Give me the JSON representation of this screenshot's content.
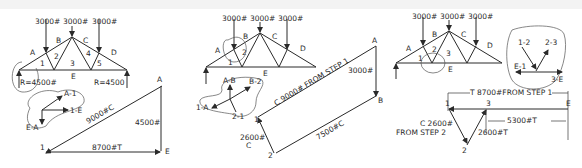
{
  "figure": {
    "panels": [
      {
        "id": "step1",
        "loads": [
          "3000#",
          "3000#",
          "3000#"
        ],
        "regions": [
          "A",
          "B",
          "C",
          "D",
          "E",
          "1",
          "2",
          "3",
          "4",
          "5"
        ],
        "reactions": {
          "left": "R=4500#",
          "right": "R=4500"
        },
        "free_body": {
          "vectors": [
            "A-1",
            "1-E",
            "E-A"
          ]
        },
        "force_polygon": {
          "points": [
            "A",
            "E",
            "1"
          ],
          "labels": {
            "hyp": "9000#C",
            "vert": "4500#",
            "base": "8700#T"
          }
        }
      },
      {
        "id": "step2",
        "loads": [
          "3000#",
          "3000#",
          "3000#"
        ],
        "regions": [
          "A",
          "B",
          "C",
          "D",
          "E",
          "1",
          "2"
        ],
        "free_body": {
          "vectors": [
            "A-B",
            "B-2",
            "1-A",
            "2-1"
          ]
        },
        "force_polygon": {
          "points": [
            "A",
            "B",
            "1",
            "2"
          ],
          "labels": {
            "top": "C 9000# FROM STEP 1",
            "vert": "3000#",
            "bottom": "7500#C",
            "left_value": "2600#",
            "left_type": "C"
          }
        }
      },
      {
        "id": "step3",
        "loads": [
          "3000#",
          "3000#",
          "3000#"
        ],
        "regions": [
          "A",
          "B",
          "C",
          "D",
          "E",
          "1",
          "2",
          "3"
        ],
        "free_body": {
          "vectors": [
            "1-2",
            "2-3",
            "E-1",
            "3-E"
          ]
        },
        "force_polygon": {
          "points": [
            "1",
            "3",
            "E",
            "2"
          ],
          "labels": {
            "top_dim": "T  8700#FROM STEP 1",
            "right_dim": "5300#T",
            "left_value": "C  2600#",
            "left_note": "FROM STEP 2",
            "right_leg": "2600#T"
          }
        }
      }
    ]
  }
}
